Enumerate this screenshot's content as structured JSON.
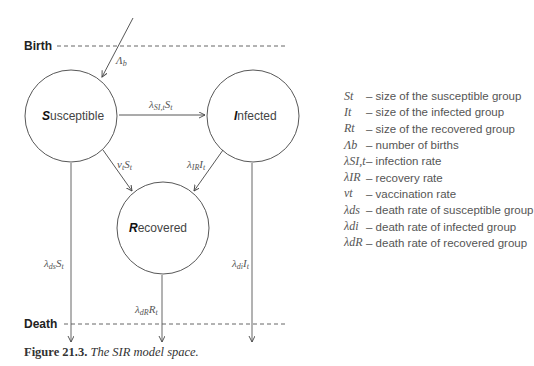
{
  "diagram": {
    "birth_label": "Birth",
    "death_label": "Death",
    "nodes": {
      "susceptible": {
        "initial": "S",
        "rest": "usceptible"
      },
      "infected": {
        "initial": "I",
        "rest": "nfected"
      },
      "recovered": {
        "initial": "R",
        "rest": "ecovered"
      }
    },
    "edges": {
      "births": "Λb",
      "infection": "λSI,t St",
      "vaccination": "vt St",
      "recovery": "λIR It",
      "death_susceptible": "λds St",
      "death_infected": "λdi It",
      "death_recovered": "λdR Rt"
    }
  },
  "legend": [
    {
      "symbol": "St",
      "desc": "– size of the susceptible group"
    },
    {
      "symbol": "It",
      "desc": "– size of the infected group"
    },
    {
      "symbol": "Rt",
      "desc": "– size of the recovered group"
    },
    {
      "symbol": "Λb",
      "desc": "– number of births"
    },
    {
      "symbol": "λSI,t",
      "desc": "– infection rate"
    },
    {
      "symbol": "λIR",
      "desc": "– recovery rate"
    },
    {
      "symbol": "vt",
      "desc": "– vaccination rate"
    },
    {
      "symbol": "λds",
      "desc": "– death rate of susceptible group"
    },
    {
      "symbol": "λdi",
      "desc": "– death rate of infected group"
    },
    {
      "symbol": "λdR",
      "desc": "– death rate of recovered group"
    }
  ],
  "caption": {
    "number": "Figure 21.3.",
    "text": "The SIR model space."
  }
}
